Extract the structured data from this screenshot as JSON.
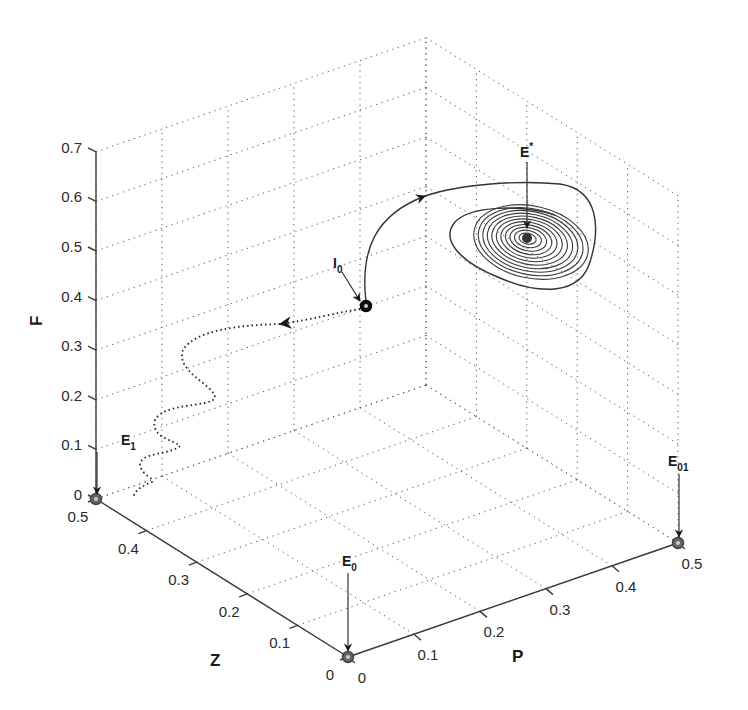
{
  "chart_data": {
    "type": "line3d",
    "title": "",
    "axes": {
      "x": {
        "label": "P",
        "range": [
          0,
          0.5
        ],
        "ticks": [
          0,
          0.1,
          0.2,
          0.3,
          0.4,
          0.5
        ],
        "tick_labels": [
          "0",
          "0.1",
          "0.2",
          "0.3",
          "0.4",
          "0.5"
        ]
      },
      "y": {
        "label": "Z",
        "range": [
          0,
          0.5
        ],
        "ticks": [
          0,
          0.1,
          0.2,
          0.3,
          0.4,
          0.5
        ],
        "tick_labels": [
          "0",
          "0.1",
          "0.2",
          "0.3",
          "0.4",
          "0.5"
        ]
      },
      "z": {
        "label": "F",
        "range": [
          0,
          0.7
        ],
        "ticks": [
          0,
          0.1,
          0.2,
          0.3,
          0.4,
          0.5,
          0.6,
          0.7
        ],
        "tick_labels": [
          "0",
          "0.1",
          "0.2",
          "0.3",
          "0.4",
          "0.5",
          "0.6",
          "0.7"
        ]
      }
    },
    "grid": true,
    "grid_style": "dotted",
    "equilibria": [
      {
        "name": "E",
        "sub": "0",
        "P": 0,
        "Z": 0,
        "F": 0
      },
      {
        "name": "E",
        "sub": "01",
        "P": 0.5,
        "Z": 0,
        "F": 0
      },
      {
        "name": "E",
        "sub": "1",
        "P": 0,
        "Z": 0.5,
        "F": 0
      },
      {
        "name": "E",
        "sup": "*",
        "P": 0.27,
        "Z": 0.33,
        "F": 0.52
      }
    ],
    "initial_point": {
      "name": "I",
      "sub": "0",
      "P": 0.14,
      "Z": 0.22,
      "F": 0.38
    },
    "series": [
      {
        "name": "trajectory to E*",
        "style": "solid",
        "behavior": "spiral convergence to E*"
      },
      {
        "name": "trajectory to E1",
        "style": "dotted",
        "behavior": "damped oscillation to E1"
      }
    ]
  },
  "labels": {
    "x_axis": "P",
    "y_axis": "Z",
    "z_axis": "F",
    "e0": {
      "main": "E",
      "sub": "0"
    },
    "e01": {
      "main": "E",
      "sub": "01"
    },
    "e1": {
      "main": "E",
      "sub": "1"
    },
    "estar": {
      "main": "E",
      "sup": "*"
    },
    "i0": {
      "main": "I",
      "sub": "0"
    }
  },
  "ticks": {
    "p": [
      "0",
      "0.1",
      "0.2",
      "0.3",
      "0.4",
      "0.5"
    ],
    "z": [
      "0",
      "0.1",
      "0.2",
      "0.3",
      "0.4",
      "0.5"
    ],
    "f": [
      "0",
      "0.1",
      "0.2",
      "0.3",
      "0.4",
      "0.5",
      "0.6",
      "0.7"
    ]
  }
}
